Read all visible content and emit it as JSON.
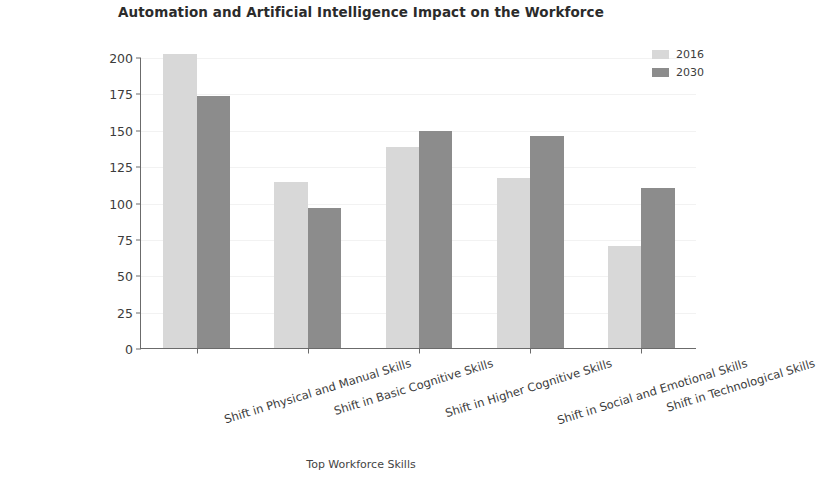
{
  "chart_data": {
    "type": "bar",
    "title": "Automation and Artificial Intelligence Impact on the Workforce",
    "xlabel": "Top Workforce Skills",
    "ylabel": "Total Hours Worked (billion)",
    "categories": [
      "Shift in Physical and Manual Skills",
      "Shift in Basic Cognitive Skills",
      "Shift in Higher Cognitive Skills",
      "Shift in Social and Emotional Skills",
      "Shift in Technological Skills"
    ],
    "series": [
      {
        "name": "2016",
        "color": "#d8d8d8",
        "values": [
          202,
          114,
          138,
          117,
          70
        ]
      },
      {
        "name": "2030",
        "color": "#8c8c8c",
        "values": [
          173,
          96,
          149,
          146,
          110
        ]
      }
    ],
    "ylim": [
      0,
      200
    ],
    "yticks": [
      0,
      25,
      50,
      75,
      100,
      125,
      150,
      175,
      200
    ],
    "ytick_labels": [
      "0",
      "25",
      "50",
      "75",
      "100",
      "125",
      "150",
      "175",
      "200"
    ],
    "grid": true,
    "legend_position": "top-right"
  },
  "legend": {
    "entries": [
      {
        "label": "2016",
        "color": "#d8d8d8"
      },
      {
        "label": "2030",
        "color": "#8c8c8c"
      }
    ]
  }
}
